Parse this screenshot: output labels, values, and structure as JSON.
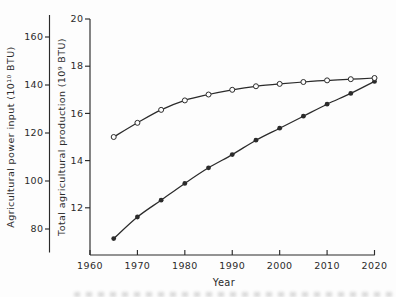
{
  "colors": {
    "ink": "#2b2b2b",
    "background": "#fdfdfd"
  },
  "chart_data": {
    "type": "line",
    "title": "",
    "xlabel": "Year",
    "x_range": [
      1960,
      2020
    ],
    "x_ticks": [
      1960,
      1970,
      1980,
      1990,
      2000,
      2010,
      2020
    ],
    "grid": false,
    "legend": false,
    "axes": {
      "power": {
        "side": "outer-left",
        "label": "Agricultural power input (10¹⁰ BTU)",
        "ticks": [
          160,
          140,
          120,
          100,
          80
        ]
      },
      "production": {
        "side": "inner-left",
        "label": "Total agricultural production (10⁹ BTU)",
        "ticks": [
          20,
          18,
          16,
          14,
          12
        ],
        "range": [
          10,
          20
        ]
      }
    },
    "series": [
      {
        "name": "Agricultural power input",
        "axis": "power",
        "marker": "filled-circle",
        "x": [
          1965,
          1970,
          1975,
          1980,
          1985,
          1990,
          1995,
          2000,
          2005,
          2010,
          2015,
          2020
        ],
        "values": [
          76,
          85,
          92,
          99,
          105.5,
          111,
          117,
          122,
          127,
          132,
          136.5,
          141.5
        ]
      },
      {
        "name": "Total agricultural production",
        "axis": "production",
        "marker": "open-circle",
        "x": [
          1965,
          1970,
          1975,
          1980,
          1985,
          1990,
          1995,
          2000,
          2005,
          2010,
          2015,
          2020
        ],
        "values": [
          15.0,
          15.6,
          16.15,
          16.55,
          16.8,
          17.0,
          17.15,
          17.25,
          17.33,
          17.4,
          17.45,
          17.5
        ]
      }
    ]
  }
}
